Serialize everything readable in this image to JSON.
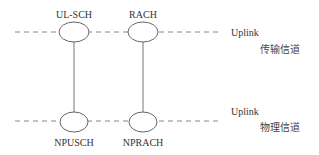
{
  "diagram": {
    "type": "channel-mapping",
    "colors": {
      "line": "#888888",
      "ellipse": "#666666",
      "text": "#333333",
      "background": "#ffffff"
    },
    "layers": [
      {
        "id": "transport",
        "direction_label": "Uplink",
        "layer_label": "传输信道",
        "y": 32
      },
      {
        "id": "physical",
        "direction_label": "Uplink",
        "layer_label": "物理信道",
        "y": 122
      }
    ],
    "transport_channels": [
      {
        "label": "UL-SCH",
        "cx": 74
      },
      {
        "label": "RACH",
        "cx": 143
      }
    ],
    "physical_channels": [
      {
        "label": "NPUSCH",
        "cx": 74
      },
      {
        "label": "NPRACH",
        "cx": 143
      }
    ],
    "mappings": [
      {
        "from": "UL-SCH",
        "to": "NPUSCH"
      },
      {
        "from": "RACH",
        "to": "NPRACH"
      }
    ]
  }
}
